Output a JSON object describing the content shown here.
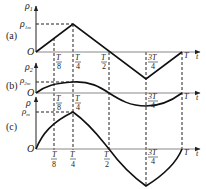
{
  "figure": {
    "panels": [
      {
        "id": "a",
        "label": "(a)",
        "y_axis": "ρ",
        "y_sub": "1",
        "peak_label": "ρ",
        "peak_sub": "1m",
        "origin": "O",
        "shape": "triangle wave: rises linearly to peak at T/4, falls linearly to minimum at 3T/4, rises back to 0 at T"
      },
      {
        "id": "b",
        "label": "(b)",
        "y_axis": "ρ",
        "y_sub": "2",
        "peak_label": "ρ",
        "peak_sub": "2m",
        "origin": "O",
        "shape": "smooth curve: rises to peak at T/4, falls below axis to minimum at 3T/4, returns to 0 at T"
      },
      {
        "id": "c",
        "label": "(c)",
        "y_axis": "ρ",
        "y_sub": "",
        "peak_label": "ρ",
        "peak_sub": "m",
        "origin": "O",
        "shape": "curve: rises concave-down to cusp peak at T/4, falls to cusp minimum at 3T/4, returns to 0 at T"
      }
    ],
    "ticks": [
      {
        "num": "T",
        "den": "8"
      },
      {
        "num": "T",
        "den": "4"
      },
      {
        "num": "T",
        "den": "2"
      },
      {
        "num": "3T",
        "den": "4"
      },
      {
        "num": "T",
        "den": ""
      }
    ],
    "x_axis": "t"
  }
}
